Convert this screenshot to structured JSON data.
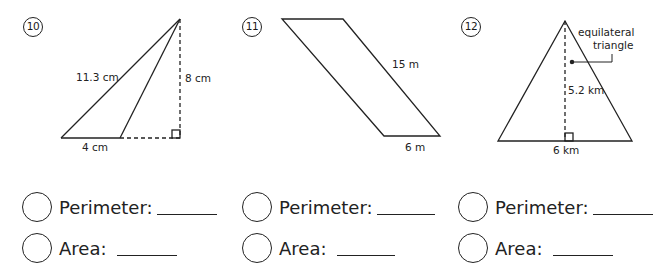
{
  "problems": [
    {
      "number": "10",
      "shape": "obtuse triangle",
      "labels": {
        "slant": "11.3 cm",
        "height": "8 cm",
        "base": "4 cm"
      },
      "answers": {
        "perimeter": "Perimeter:",
        "area": "Area:"
      }
    },
    {
      "number": "11",
      "shape": "parallelogram",
      "labels": {
        "side": "15 m",
        "base": "6 m"
      },
      "answers": {
        "perimeter": "Perimeter:",
        "area": "Area:"
      }
    },
    {
      "number": "12",
      "shape": "equilateral triangle",
      "labels": {
        "callout_line1": "equilateral",
        "callout_line2": "triangle",
        "height": "5.2 km",
        "base": "6 km"
      },
      "answers": {
        "perimeter": "Perimeter:",
        "area": "Area:"
      }
    }
  ]
}
